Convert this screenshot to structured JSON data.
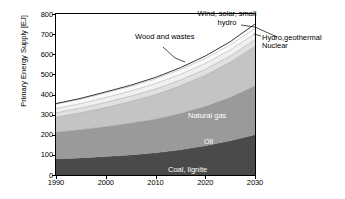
{
  "chart_data": {
    "type": "area",
    "title": "",
    "subtitle": "",
    "xlabel": "",
    "ylabel": "Primary Energy Supply [EJ]",
    "xlim": [
      1990,
      2030
    ],
    "ylim": [
      0,
      800
    ],
    "grid": false,
    "stacked": true,
    "legend_position": "annotations",
    "x": [
      1990,
      1995,
      2000,
      2005,
      2010,
      2015,
      2020,
      2025,
      2030
    ],
    "xticks": [
      "1990",
      "2000",
      "2010",
      "2020",
      "2030"
    ],
    "yticks": [
      "0",
      "100",
      "200",
      "300",
      "400",
      "500",
      "600",
      "700",
      "800"
    ],
    "series": [
      {
        "name": "Coal, lignite",
        "color": "#4a4a4a",
        "values": [
          80,
          85,
          92,
          100,
          110,
          125,
          145,
          170,
          200
        ]
      },
      {
        "name": "Oil",
        "color": "#9a9a9a",
        "values": [
          133,
          140,
          148,
          157,
          167,
          180,
          195,
          215,
          242
        ]
      },
      {
        "name": "Natural gas",
        "color": "#c4c4c4",
        "values": [
          74,
          84,
          95,
          108,
          122,
          138,
          155,
          175,
          198
        ]
      },
      {
        "name": "Nuclear",
        "color": "#e0e0e0",
        "values": [
          22,
          24,
          26,
          27,
          28,
          29,
          30,
          31,
          32
        ]
      },
      {
        "name": "Hydro,geothermal",
        "color": "#f0f0f0",
        "values": [
          21,
          22,
          24,
          25,
          27,
          28,
          29,
          30,
          31
        ]
      },
      {
        "name": "Wood and wastes",
        "color": "#fafafa",
        "values": [
          22,
          22,
          23,
          23,
          24,
          24,
          25,
          25,
          26
        ]
      },
      {
        "name": "Wind, solar, small hydro",
        "color": "#ffffff",
        "values": [
          3,
          4,
          5,
          6,
          7,
          9,
          12,
          16,
          21
        ]
      }
    ],
    "totals": [
      355,
      381,
      413,
      446,
      485,
      533,
      591,
      662,
      750
    ],
    "annotations": [
      {
        "name": "wind-solar-label",
        "line1": "Wind, solar, small",
        "line2": "hydro"
      },
      {
        "name": "wood-wastes-label",
        "text": "Wood and wastes"
      },
      {
        "name": "hydro-geothermal-label",
        "text": "Hydro,geothermal"
      },
      {
        "name": "nuclear-label",
        "text": "Nuclear"
      }
    ]
  },
  "axis": {
    "ylabel": "Primary Energy Supply [EJ]",
    "yticks": [
      {
        "value": "800"
      },
      {
        "value": "700"
      },
      {
        "value": "600"
      },
      {
        "value": "500"
      },
      {
        "value": "400"
      },
      {
        "value": "300"
      },
      {
        "value": "200"
      },
      {
        "value": "100"
      },
      {
        "value": "0"
      }
    ],
    "xticks": [
      {
        "value": "1990"
      },
      {
        "value": "2000"
      },
      {
        "value": "2010"
      },
      {
        "value": "2020"
      },
      {
        "value": "2030"
      }
    ]
  },
  "band_labels": {
    "coal": "Coal, lignite",
    "oil": "Oil",
    "gas": "Natural gas"
  },
  "callouts": {
    "wind_line1": "Wind, solar, small",
    "wind_line2": "hydro",
    "wood": "Wood and wastes",
    "hydro_geothermal": "Hydro,geothermal",
    "nuclear": "Nuclear"
  }
}
